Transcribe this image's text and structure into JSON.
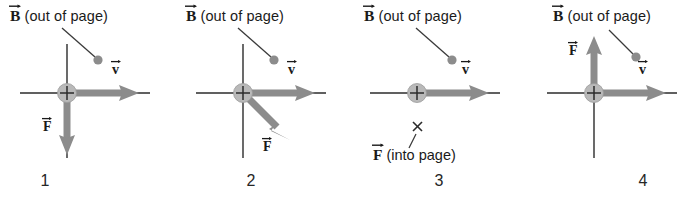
{
  "figure": {
    "background_color": "#ffffff",
    "axis_color": "#2b2b2b",
    "vector_color": "#8c8c8c",
    "charge_fill": "#b9b9b9",
    "text_color": "#1a1a1a",
    "symbols": {
      "b_vector": "B",
      "v_vector": "v",
      "f_vector": "F",
      "charge_sign": "+",
      "into_page_mark": "×"
    },
    "labels": {
      "b_out_of_page": "(out of page)",
      "f_into_page": "(into page)"
    }
  },
  "panels": [
    {
      "number": "1",
      "b_label": "(out of page)",
      "b_symbol": "B",
      "v_symbol": "v",
      "f_symbol": "F",
      "f_direction": "down",
      "f_note": "",
      "has_vertical_axis": true,
      "has_f_arrow": true
    },
    {
      "number": "2",
      "b_label": "(out of page)",
      "b_symbol": "B",
      "v_symbol": "v",
      "f_symbol": "F",
      "f_direction": "down-right",
      "f_note": "",
      "has_vertical_axis": true,
      "has_f_arrow": true
    },
    {
      "number": "3",
      "b_label": "(out of page)",
      "b_symbol": "B",
      "v_symbol": "v",
      "f_symbol": "F",
      "f_direction": "into-page",
      "f_note": "(into page)",
      "has_vertical_axis": false,
      "has_f_arrow": false
    },
    {
      "number": "4",
      "b_label": "(out of page)",
      "b_symbol": "B",
      "v_symbol": "v",
      "f_symbol": "F",
      "f_direction": "up",
      "f_note": "",
      "has_vertical_axis": true,
      "has_f_arrow": true
    }
  ]
}
